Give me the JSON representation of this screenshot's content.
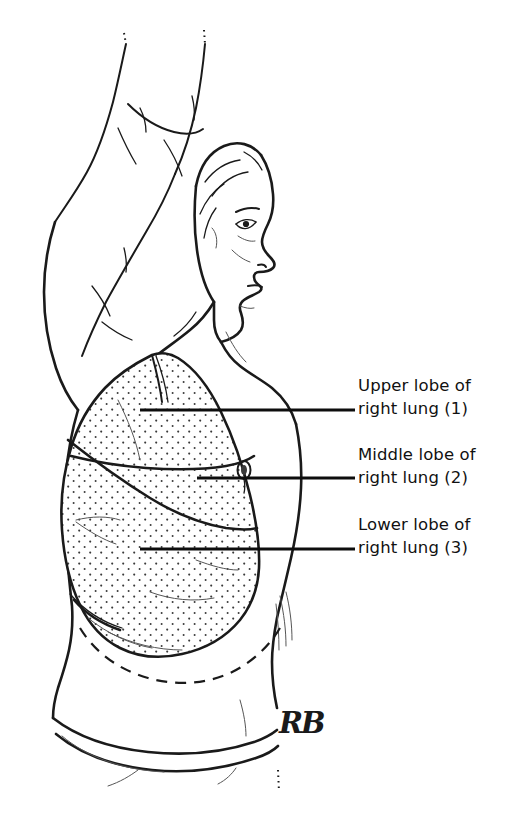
{
  "figure": {
    "background_color": "#ffffff",
    "ink_color": "#1a1a1a",
    "text_color": "#111111",
    "artist_monogram": "RB"
  },
  "labels": [
    {
      "id": "upper-lobe",
      "line1": "Upper lobe of",
      "line2": "right lung (1)",
      "number": "1",
      "leader": {
        "x1": 140,
        "y1": 410,
        "x2": 355,
        "y2": 410
      },
      "text_x": 358,
      "text_y": 374
    },
    {
      "id": "middle-lobe",
      "line1": "Middle lobe of",
      "line2": "right lung (2)",
      "number": "2",
      "leader": {
        "x1": 197,
        "y1": 478,
        "x2": 355,
        "y2": 478
      },
      "text_x": 358,
      "text_y": 443
    },
    {
      "id": "lower-lobe",
      "line1": "Lower lobe of",
      "line2": "right lung (3)",
      "number": "3",
      "leader": {
        "x1": 140,
        "y1": 549,
        "x2": 355,
        "y2": 549
      },
      "text_x": 358,
      "text_y": 513
    }
  ],
  "anatomy_parts": [
    {
      "name": "raised-right-arm",
      "interactable": false
    },
    {
      "name": "head-profile",
      "interactable": false
    },
    {
      "name": "neck",
      "interactable": false
    },
    {
      "name": "torso-outline",
      "interactable": false
    },
    {
      "name": "right-lung-stippled",
      "interactable": false
    },
    {
      "name": "horizontal-fissure",
      "interactable": false
    },
    {
      "name": "oblique-fissure",
      "interactable": false
    },
    {
      "name": "nipple",
      "interactable": false
    },
    {
      "name": "costal-margin-dashed",
      "interactable": false
    },
    {
      "name": "waistband",
      "interactable": false
    }
  ]
}
